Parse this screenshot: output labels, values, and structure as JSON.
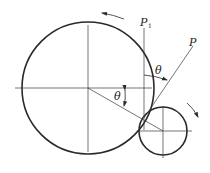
{
  "diagram": {
    "colors": {
      "stroke": "#2a2a2a",
      "thin": "#3a3a3a",
      "background": "#ffffff"
    },
    "large_circle": {
      "cx": 88,
      "cy": 88,
      "r": 66
    },
    "small_circle": {
      "cx": 163,
      "cy": 131,
      "r": 24
    },
    "labels": {
      "p1": "P",
      "p1_sub": "1",
      "p": "P",
      "theta_upper": "θ",
      "theta_lower": "θ"
    },
    "arrows": {
      "large_rotation": "counter-clockwise",
      "small_rotation": "clockwise"
    }
  }
}
